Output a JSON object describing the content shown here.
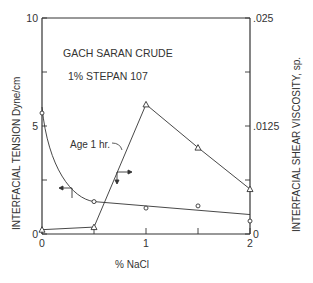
{
  "chart_data": {
    "type": "line",
    "title": "GACH SARAN CRUDE",
    "subtitle": "1% STEPAN 107",
    "xlabel": "% NaCl",
    "ylabel_left": "INTERFACIAL TENSION Dyne/cm",
    "ylabel_right": "INTERFACIAL SHEAR VISCOSITY, sp.",
    "xlim": [
      0,
      2
    ],
    "ylim_left": [
      0,
      10
    ],
    "ylim_right": [
      0,
      0.025
    ],
    "x_ticks": [
      "0",
      "1",
      "2"
    ],
    "y_left_ticks": [
      "0",
      "5",
      "10"
    ],
    "y_right_ticks": [
      "0",
      ".0125",
      ".025"
    ],
    "grid": false,
    "annotations": [
      "Age 1 hr."
    ],
    "series": [
      {
        "name": "Interfacial Tension",
        "marker": "circle",
        "axis": "left",
        "x": [
          0,
          0.5,
          1.0,
          1.5,
          2.0
        ],
        "values": [
          5.6,
          1.5,
          1.2,
          1.3,
          0.6
        ]
      },
      {
        "name": "Interfacial Shear Viscosity",
        "marker": "triangle",
        "axis": "right",
        "x": [
          0,
          0.5,
          1.0,
          1.5,
          2.0
        ],
        "values": [
          0.0005,
          0.0008,
          0.015,
          0.01,
          0.0052
        ]
      }
    ]
  }
}
